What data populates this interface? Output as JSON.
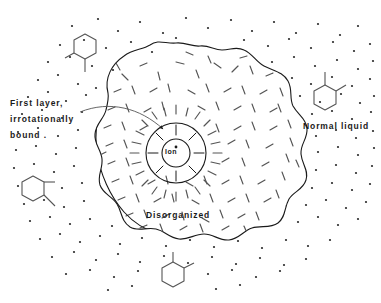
{
  "figure": {
    "background_color": "#ffffff",
    "ink_color": "#1a1a1a",
    "width": 381,
    "height": 303
  },
  "labels": {
    "first_layer": {
      "line1": "First layer,",
      "line2": "irrotationally",
      "line3": "bound ."
    },
    "normal_liquid": "Normal liquid",
    "disorganized": "Disorganized",
    "ion": "Ion"
  },
  "regions": [
    {
      "name": "ion-core",
      "label": "Ion",
      "description": "central ion drawn as a small circle with a dot at its centre"
    },
    {
      "name": "first-layer",
      "label": "First layer, irrotationally bound",
      "description": "annular shell of radially oriented solvent molecules immediately around the ion"
    },
    {
      "name": "disorganized-region",
      "label": "Disorganized",
      "description": "large irregular blob of randomly oriented short dashes between the first layer and the bulk"
    },
    {
      "name": "normal-liquid",
      "label": "Normal liquid",
      "description": "bulk liquid outside the blob rendered as a field of scattered dots"
    }
  ],
  "molecules": [
    {
      "name": "molecule-top-left",
      "x": 85,
      "y": 52,
      "rotation": 0,
      "description": "hexagonal ring with two substituent bonds"
    },
    {
      "name": "molecule-right",
      "x": 325,
      "y": 98,
      "rotation": 0,
      "description": "hexagonal ring with two substituent bonds"
    },
    {
      "name": "molecule-left",
      "x": 33,
      "y": 193,
      "rotation": 0,
      "description": "hexagonal ring with two substituent bonds"
    },
    {
      "name": "molecule-bottom",
      "x": 173,
      "y": 280,
      "rotation": 180,
      "description": "hexagonal ring with two substituent bonds"
    }
  ],
  "geometry": {
    "ion_center": {
      "x": 176,
      "y": 153
    },
    "ion_core_radius": 14,
    "first_layer_radius": 36,
    "leader_line": "curve from the 'First layer, irrotationally bound' caption to an arrowhead on the first-layer shell"
  }
}
